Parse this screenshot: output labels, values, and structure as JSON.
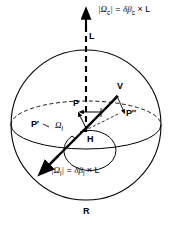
{
  "figure": {
    "background_color": "#ffffff",
    "line_color": "#000000"
  },
  "labels": {
    "omega_c_equation": "|Ωc| = δβc × L",
    "omega_c_parts": {
      "bar_open": "|",
      "omega": "Ω",
      "sub_c": "c",
      "bar_close": "|",
      "equals": " = ",
      "delta": "δ",
      "beta": "β",
      "sub_c2": "c",
      "times": " × ",
      "L": "L"
    },
    "omega_l_equation": "|Ωl| = δβl × L",
    "omega_l_parts": {
      "bar_open": "|",
      "omega": "Ω",
      "sub_l": "l",
      "bar_close": "|",
      "equals": " = ",
      "delta": "δ",
      "beta": "β",
      "sub_l2": "l",
      "times": " × ",
      "L": "L"
    },
    "axis_L": "L",
    "point_V": "V",
    "point_P": "P",
    "point_P_prime": "P′",
    "point_P_double_prime": "P″",
    "point_H": "H",
    "sphere_R": "R",
    "angle_omega": "Ω",
    "angle_omega_sub": "l"
  },
  "geometry": {
    "sphere_center_x": 86,
    "sphere_center_y": 125,
    "sphere_radius": 75,
    "equator_rx": 75,
    "equator_ry": 24,
    "axis_x": 86,
    "axis_top_y": 18,
    "axis_bottom_y": 132
  }
}
